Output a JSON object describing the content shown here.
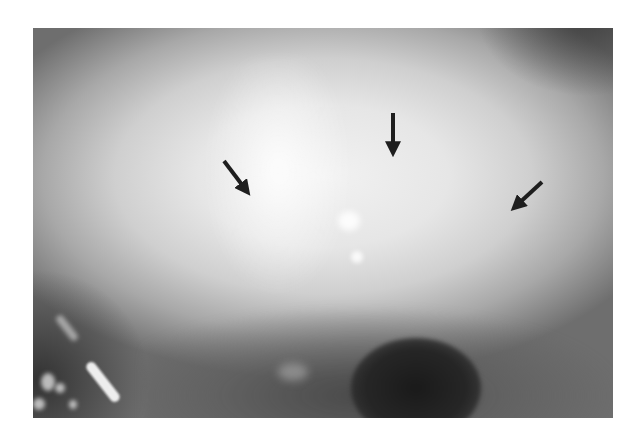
{
  "image": {
    "description": "Grayscale clinical photograph of an eye with a hazy bright central region and three black arrows pointing to the area of interest",
    "colors": {
      "background": "#ffffff",
      "arrow": "#1e1e1e",
      "highlight": "#f2f2f2",
      "pupil": "#1a1a1a"
    },
    "arrows": [
      {
        "name": "arrow-left",
        "direction": "down-right",
        "tail": [
          224,
          161
        ],
        "tip": [
          252,
          198
        ]
      },
      {
        "name": "arrow-center",
        "direction": "down",
        "tail": [
          393,
          113
        ],
        "tip": [
          393,
          160
        ]
      },
      {
        "name": "arrow-right",
        "direction": "down-left",
        "tail": [
          542,
          182
        ],
        "tip": [
          510,
          212
        ]
      }
    ]
  }
}
